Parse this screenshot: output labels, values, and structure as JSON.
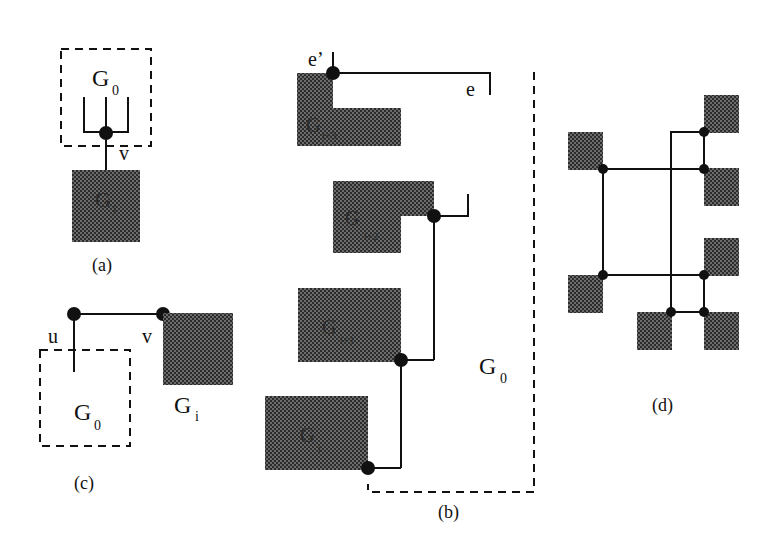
{
  "figure": {
    "panels": [
      {
        "id": "a",
        "caption": "(a)"
      },
      {
        "id": "b",
        "caption": "(b)"
      },
      {
        "id": "c",
        "caption": "(c)"
      },
      {
        "id": "d",
        "caption": "(d)"
      }
    ]
  },
  "panel_a": {
    "outer_label": "G",
    "outer_sub": "0",
    "block_label": "G",
    "block_sub": "i",
    "vertex_label": "v"
  },
  "panel_b": {
    "region_label": "G",
    "region_sub": "0",
    "edge_label": "e",
    "edge_prime_label": "e’",
    "blocks": [
      {
        "label": "G",
        "sub": "i+3"
      },
      {
        "label": "G",
        "sub": "i+2"
      },
      {
        "label": "G",
        "sub": "i+1"
      },
      {
        "label": "G",
        "sub": "i"
      }
    ]
  },
  "panel_c": {
    "u_label": "u",
    "v_label": "v",
    "region_label": "G",
    "region_sub": "0",
    "block_label": "G",
    "block_sub": "i"
  },
  "colors": {
    "ink": "#111111",
    "block_fill": "#3a3a3a"
  }
}
